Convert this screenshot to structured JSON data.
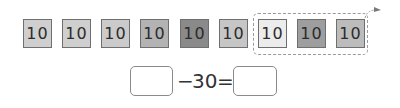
{
  "tiles": [
    {
      "label": "10",
      "color": "#cfcfcf"
    },
    {
      "label": "10",
      "color": "#cfcfcf"
    },
    {
      "label": "10",
      "color": "#cbcbcb"
    },
    {
      "label": "10",
      "color": "#b3b3b3"
    },
    {
      "label": "10",
      "color": "#8a8a8a"
    },
    {
      "label": "10",
      "color": "#c6c6c6"
    },
    {
      "label": "10",
      "color": "#ececec"
    },
    {
      "label": "10",
      "color": "#9e9e9e"
    },
    {
      "label": "10",
      "color": "#bcbcbc"
    }
  ],
  "group": {
    "tiles_included": 3,
    "arrow": "curved-arrow-right"
  },
  "equation": {
    "blank_left": "",
    "operator": "−",
    "operand": "30",
    "equals": "=",
    "blank_right": ""
  }
}
